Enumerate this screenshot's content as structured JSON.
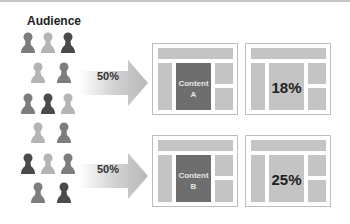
{
  "title": "Audience",
  "colors": {
    "dark": "#4a4a4a",
    "mid": "#7d7d7d",
    "light": "#b4b4b4"
  },
  "audience": [
    {
      "x": 20,
      "y": 32,
      "shade": "mid"
    },
    {
      "x": 40,
      "y": 32,
      "shade": "light"
    },
    {
      "x": 60,
      "y": 32,
      "shade": "dark"
    },
    {
      "x": 30,
      "y": 62,
      "shade": "light"
    },
    {
      "x": 56,
      "y": 62,
      "shade": "mid"
    },
    {
      "x": 20,
      "y": 93,
      "shade": "mid"
    },
    {
      "x": 40,
      "y": 93,
      "shade": "dark"
    },
    {
      "x": 60,
      "y": 93,
      "shade": "light"
    },
    {
      "x": 30,
      "y": 122,
      "shade": "light"
    },
    {
      "x": 56,
      "y": 122,
      "shade": "mid"
    },
    {
      "x": 20,
      "y": 153,
      "shade": "dark"
    },
    {
      "x": 40,
      "y": 153,
      "shade": "light"
    },
    {
      "x": 60,
      "y": 153,
      "shade": "mid"
    },
    {
      "x": 30,
      "y": 182,
      "shade": "mid"
    },
    {
      "x": 56,
      "y": 182,
      "shade": "dark"
    }
  ],
  "variants": [
    {
      "split": "50%",
      "content_label": "Content",
      "content_id": "A",
      "result": "18%"
    },
    {
      "split": "50%",
      "content_label": "Content",
      "content_id": "B",
      "result": "25%"
    }
  ]
}
